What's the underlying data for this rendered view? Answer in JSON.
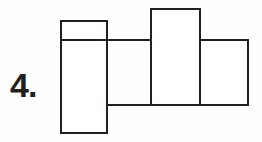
{
  "document": {
    "kind": "technical-drawing",
    "background_color": "#fefefe",
    "line_color": "#231f20",
    "fill_color": "#ffffff"
  },
  "label": {
    "name": "problem-number",
    "text": "4."
  },
  "drawing": {
    "title": "stepped-part-outline",
    "stroke_width": 2,
    "stroke_color": "#231f20",
    "fill_color": "#ffffff",
    "shapes": [
      {
        "name": "left-flange-rect",
        "x": 61,
        "y": 21,
        "width": 46,
        "height": 112
      },
      {
        "name": "center-tall-rect",
        "x": 151,
        "y": 9,
        "width": 49,
        "height": 96
      },
      {
        "name": "right-step-rect",
        "x": 200,
        "y": 40,
        "width": 48,
        "height": 65
      }
    ],
    "lines": [
      {
        "name": "upper-body-line",
        "x1": 61,
        "y1": 40,
        "x2": 151,
        "y2": 40
      },
      {
        "name": "lower-body-line",
        "x1": 107,
        "y1": 105,
        "x2": 200,
        "y2": 105
      },
      {
        "name": "upper-right-body-line",
        "x1": 200,
        "y1": 40,
        "x2": 248,
        "y2": 40
      }
    ]
  }
}
